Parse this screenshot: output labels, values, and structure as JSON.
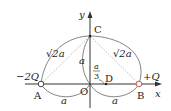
{
  "diagram": {
    "axes": {
      "x_label": "x",
      "y_label": "y"
    },
    "points": {
      "A": {
        "label": "A",
        "charge": "−2Q"
      },
      "B": {
        "label": "B",
        "charge": "+Q"
      },
      "C": {
        "label": "C"
      },
      "D": {
        "label": "D"
      },
      "O": {
        "label": "O"
      }
    },
    "lengths": {
      "AC": "√2a",
      "BC": "√2a",
      "OC": "a",
      "AO": "a",
      "OB": "a",
      "OD_num": "a",
      "OD_den": "3"
    },
    "colors": {
      "line": "#333333",
      "dotted": "#888888",
      "arc": "#555555"
    }
  }
}
